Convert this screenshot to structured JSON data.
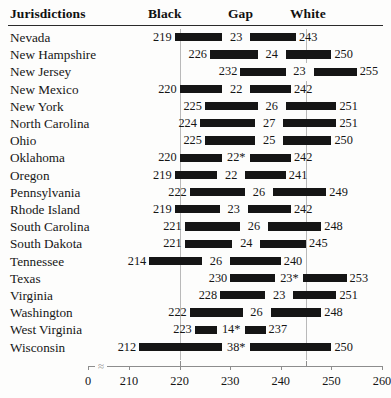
{
  "header": {
    "jurisdictions": "Jurisdictions",
    "black": "Black",
    "gap": "Gap",
    "white": "White"
  },
  "axis": {
    "zero_label": "0",
    "break_symbol": "⸺",
    "ticks": [
      210,
      220,
      230,
      240,
      250,
      260
    ],
    "tick_labels": [
      "210",
      "220",
      "230",
      "240",
      "250",
      "260"
    ]
  },
  "gridlines": [
    220,
    245
  ],
  "footnote_marker": "*",
  "chart_data": {
    "type": "bar",
    "title": "",
    "subtitle": "",
    "xlabel": "",
    "ylabel": "Jurisdictions",
    "xlim": [
      210,
      260
    ],
    "grid": true,
    "grid_values": [
      220,
      245
    ],
    "legend": [],
    "orientation": "horizontal",
    "bar_style": "range-bar (Black score to White score)",
    "columns": [
      "Jurisdictions",
      "Black",
      "Gap",
      "White"
    ],
    "categories": [
      "Nevada",
      "New Hampshire",
      "New Jersey",
      "New Mexico",
      "New York",
      "North Carolina",
      "Ohio",
      "Oklahoma",
      "Oregon",
      "Pennsylvania",
      "Rhode Island",
      "South Carolina",
      "South Dakota",
      "Tennessee",
      "Texas",
      "Virginia",
      "Washington",
      "West Virginia",
      "Wisconsin"
    ],
    "series": [
      {
        "name": "Black",
        "values": [
          219,
          226,
          232,
          220,
          225,
          224,
          225,
          220,
          219,
          222,
          219,
          221,
          221,
          214,
          230,
          228,
          222,
          223,
          212
        ]
      },
      {
        "name": "Gap",
        "values": [
          23,
          24,
          23,
          22,
          26,
          27,
          25,
          22,
          22,
          26,
          23,
          26,
          24,
          26,
          23,
          23,
          26,
          14,
          38
        ]
      },
      {
        "name": "White",
        "values": [
          243,
          250,
          255,
          242,
          251,
          251,
          250,
          242,
          241,
          249,
          242,
          248,
          245,
          240,
          253,
          251,
          248,
          237,
          250
        ]
      }
    ],
    "rows": [
      {
        "jurisdiction": "Nevada",
        "black": 219,
        "black_label": "219",
        "gap": 23,
        "gap_label": "23",
        "white": 243,
        "white_label": "243"
      },
      {
        "jurisdiction": "New Hampshire",
        "black": 226,
        "black_label": "226",
        "gap": 24,
        "gap_label": "24",
        "white": 250,
        "white_label": "250"
      },
      {
        "jurisdiction": "New Jersey",
        "black": 232,
        "black_label": "232",
        "gap": 23,
        "gap_label": "23",
        "white": 255,
        "white_label": "255"
      },
      {
        "jurisdiction": "New Mexico",
        "black": 220,
        "black_label": "220",
        "gap": 22,
        "gap_label": "22",
        "white": 242,
        "white_label": "242"
      },
      {
        "jurisdiction": "New York",
        "black": 225,
        "black_label": "225",
        "gap": 26,
        "gap_label": "26",
        "white": 251,
        "white_label": "251"
      },
      {
        "jurisdiction": "North Carolina",
        "black": 224,
        "black_label": "224",
        "gap": 27,
        "gap_label": "27",
        "white": 251,
        "white_label": "251"
      },
      {
        "jurisdiction": "Ohio",
        "black": 225,
        "black_label": "225",
        "gap": 25,
        "gap_label": "25",
        "white": 250,
        "white_label": "250"
      },
      {
        "jurisdiction": "Oklahoma",
        "black": 220,
        "black_label": "220",
        "gap": 22,
        "gap_label": "22*",
        "white": 242,
        "white_label": "242"
      },
      {
        "jurisdiction": "Oregon",
        "black": 219,
        "black_label": "219",
        "gap": 22,
        "gap_label": "22",
        "white": 241,
        "white_label": "241"
      },
      {
        "jurisdiction": "Pennsylvania",
        "black": 222,
        "black_label": "222",
        "gap": 26,
        "gap_label": "26",
        "white": 249,
        "white_label": "249"
      },
      {
        "jurisdiction": "Rhode Island",
        "black": 219,
        "black_label": "219",
        "gap": 23,
        "gap_label": "23",
        "white": 242,
        "white_label": "242"
      },
      {
        "jurisdiction": "South Carolina",
        "black": 221,
        "black_label": "221",
        "gap": 26,
        "gap_label": "26",
        "white": 248,
        "white_label": "248"
      },
      {
        "jurisdiction": "South Dakota",
        "black": 221,
        "black_label": "221",
        "gap": 24,
        "gap_label": "24",
        "white": 245,
        "white_label": "245"
      },
      {
        "jurisdiction": "Tennessee",
        "black": 214,
        "black_label": "214",
        "gap": 26,
        "gap_label": "26",
        "white": 240,
        "white_label": "240"
      },
      {
        "jurisdiction": "Texas",
        "black": 230,
        "black_label": "230",
        "gap": 23,
        "gap_label": "23*",
        "white": 253,
        "white_label": "253"
      },
      {
        "jurisdiction": "Virginia",
        "black": 228,
        "black_label": "228",
        "gap": 23,
        "gap_label": "23",
        "white": 251,
        "white_label": "251"
      },
      {
        "jurisdiction": "Washington",
        "black": 222,
        "black_label": "222",
        "gap": 26,
        "gap_label": "26",
        "white": 248,
        "white_label": "248"
      },
      {
        "jurisdiction": "West Virginia",
        "black": 223,
        "black_label": "223",
        "gap": 14,
        "gap_label": "14*",
        "white": 237,
        "white_label": "237"
      },
      {
        "jurisdiction": "Wisconsin",
        "black": 212,
        "black_label": "212",
        "gap": 38,
        "gap_label": "38*",
        "white": 250,
        "white_label": "250"
      }
    ]
  }
}
